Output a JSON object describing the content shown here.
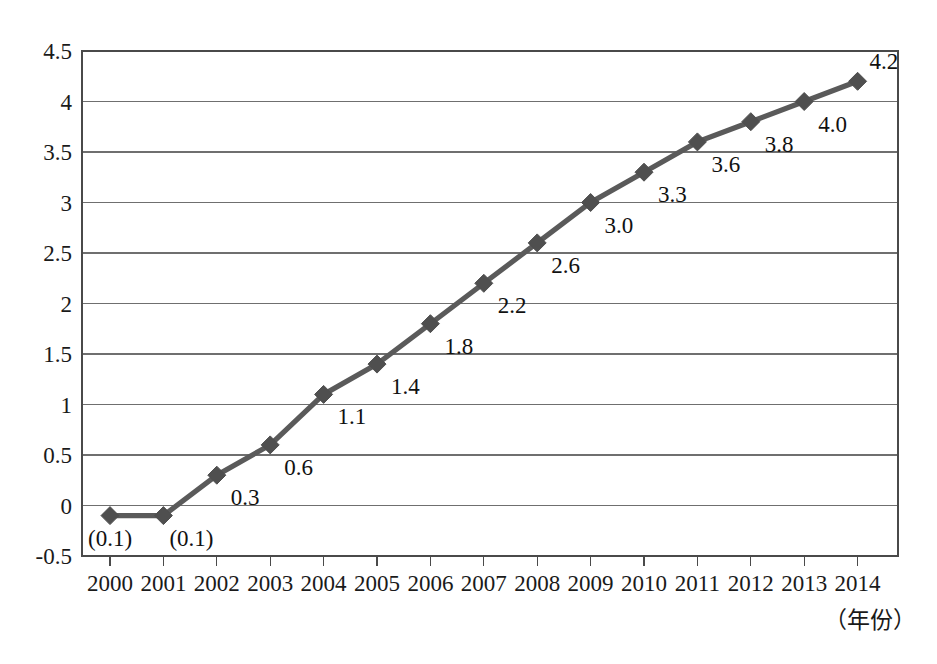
{
  "chart_data": {
    "type": "line",
    "title": "",
    "subtitle": "",
    "xlabel": "（年份）",
    "ylabel": "",
    "categories": [
      "2000",
      "2001",
      "2002",
      "2003",
      "2004",
      "2005",
      "2006",
      "2007",
      "2008",
      "2009",
      "2010",
      "2011",
      "2012",
      "2013",
      "2014"
    ],
    "x": [
      2000,
      2001,
      2002,
      2003,
      2004,
      2005,
      2006,
      2007,
      2008,
      2009,
      2010,
      2011,
      2012,
      2013,
      2014
    ],
    "values": [
      -0.1,
      -0.1,
      0.3,
      0.6,
      1.1,
      1.4,
      1.8,
      2.2,
      2.6,
      3.0,
      3.3,
      3.6,
      3.8,
      4.0,
      4.2
    ],
    "point_labels": [
      "(0.1)",
      "(0.1)",
      "0.3",
      "0.6",
      "1.1",
      "1.4",
      "1.8",
      "2.2",
      "2.6",
      "3.0",
      "3.3",
      "3.6",
      "3.8",
      "4.0",
      "4.2"
    ],
    "series": [
      {
        "name": "",
        "values": [
          -0.1,
          -0.1,
          0.3,
          0.6,
          1.1,
          1.4,
          1.8,
          2.2,
          2.6,
          3.0,
          3.3,
          3.6,
          3.8,
          4.0,
          4.2
        ],
        "color": "#5a5a5a",
        "marker": "diamond"
      }
    ],
    "ylim": [
      -0.5,
      4.5
    ],
    "ytick_labels": [
      "4.5",
      "4",
      "3.5",
      "3",
      "2.5",
      "2",
      "1.5",
      "1",
      "0.5",
      "0",
      "-0.5"
    ],
    "ytick_values": [
      4.5,
      4,
      3.5,
      3,
      2.5,
      2,
      1.5,
      1,
      0.5,
      0,
      -0.5
    ],
    "grid": true,
    "grid_axis": "y",
    "legend": false,
    "legend_position": "none",
    "colors": {
      "line": "#5a5a5a",
      "marker": "#4f4f4f",
      "grid": "#6f6f6f",
      "border": "#4a4a4a",
      "text": "#1a1a1a",
      "background": "#ffffff"
    }
  }
}
